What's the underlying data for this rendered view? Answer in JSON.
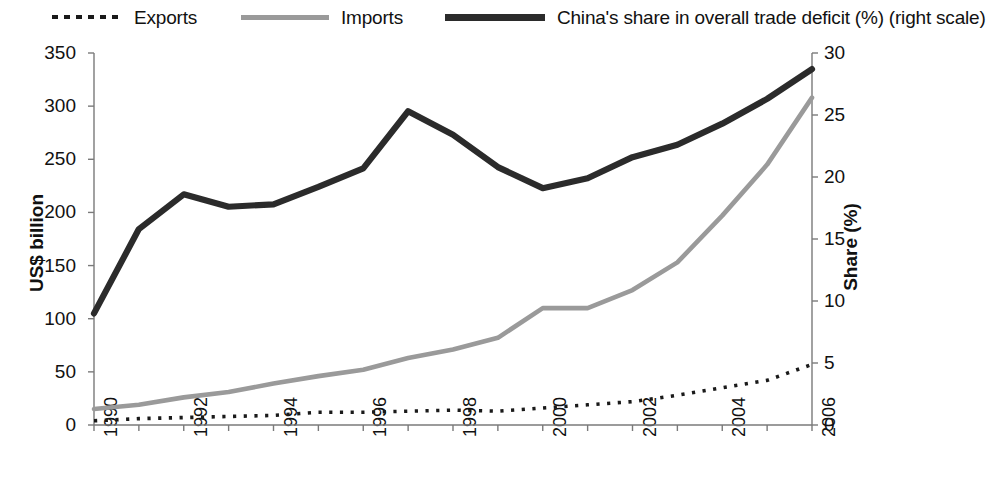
{
  "legend": {
    "items": [
      {
        "label": "Exports",
        "style": "dotted",
        "color": "#1a1a1a",
        "name": "legend-exports"
      },
      {
        "label": "Imports",
        "style": "solid",
        "color": "#9a9a9a",
        "name": "legend-imports"
      },
      {
        "label": "China's share in overall trade deficit (%) (right scale)",
        "style": "solid-thick",
        "color": "#2b2b2b",
        "name": "legend-share"
      }
    ]
  },
  "axes": {
    "y_left_title": "US$ billion",
    "y_right_title": "Share (%)",
    "y_left_ticks": [
      "0",
      "50",
      "100",
      "150",
      "200",
      "250",
      "300",
      "350"
    ],
    "y_right_ticks": [
      "0",
      "5",
      "10",
      "15",
      "20",
      "25",
      "30"
    ],
    "x_ticks": [
      "1990",
      "1992",
      "1994",
      "1996",
      "1998",
      "2000",
      "2002",
      "2004",
      "2006"
    ]
  },
  "chart_data": {
    "type": "line",
    "title": "",
    "xlabel": "",
    "ylabel": "US$ billion",
    "y2label": "Share (%)",
    "ylim": [
      0,
      350
    ],
    "y2lim": [
      0,
      30
    ],
    "xlim": [
      1990,
      2006
    ],
    "grid": false,
    "legend_position": "top",
    "x": [
      1990,
      1991,
      1992,
      1993,
      1994,
      1995,
      1996,
      1997,
      1998,
      1999,
      2000,
      2001,
      2002,
      2003,
      2004,
      2005,
      2006
    ],
    "series": [
      {
        "name": "Exports",
        "axis": "left",
        "units": "US$ billion",
        "style": "dotted",
        "color": "#1a1a1a",
        "values": [
          4,
          6,
          7,
          8,
          9,
          12,
          12,
          13,
          14,
          13,
          16,
          19,
          22,
          28,
          35,
          42,
          57
        ]
      },
      {
        "name": "Imports",
        "axis": "left",
        "units": "US$ billion",
        "style": "solid",
        "color": "#9a9a9a",
        "values": [
          15,
          19,
          26,
          31,
          39,
          46,
          52,
          63,
          71,
          82,
          110,
          110,
          127,
          153,
          197,
          245,
          308
        ]
      },
      {
        "name": "China's share in overall trade deficit (%) (right scale)",
        "axis": "right",
        "units": "%",
        "style": "solid-thick",
        "color": "#2b2b2b",
        "values": [
          9.0,
          15.8,
          18.6,
          17.6,
          17.8,
          19.2,
          20.7,
          25.3,
          23.4,
          20.8,
          19.1,
          19.9,
          21.6,
          22.6,
          24.3,
          26.3,
          28.7
        ]
      }
    ]
  }
}
